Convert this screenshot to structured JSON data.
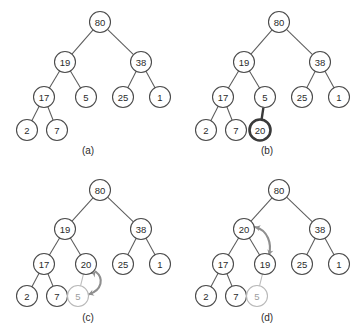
{
  "figure": {
    "colors": {
      "node_stroke": "#4b4b4b",
      "node_fill": "#ffffff",
      "node_text": "#2b2b2b",
      "edge": "#5c5c5c",
      "highlight_stroke": "#3a3a3a",
      "faded_stroke": "#b9b9b9",
      "faded_text": "#9d9d9d",
      "arrow": "#8f8f8f",
      "background": "#ffffff"
    },
    "node_radius": 10.5,
    "panels": [
      {
        "id": "panel-a",
        "caption": "(a)",
        "caption_pos": {
          "x": 88,
          "y": 150
        },
        "origin": {
          "x": 0,
          "y": 0
        },
        "size": {
          "w": 179,
          "h": 166
        },
        "nodes": [
          {
            "id": "a-80",
            "label": "80",
            "x": 100,
            "y": 22,
            "style": "normal"
          },
          {
            "id": "a-19",
            "label": "19",
            "x": 65,
            "y": 62,
            "style": "normal"
          },
          {
            "id": "a-38",
            "label": "38",
            "x": 141,
            "y": 62,
            "style": "normal"
          },
          {
            "id": "a-17",
            "label": "17",
            "x": 44,
            "y": 97,
            "style": "normal"
          },
          {
            "id": "a-5",
            "label": "5",
            "x": 86,
            "y": 97,
            "style": "normal"
          },
          {
            "id": "a-25",
            "label": "25",
            "x": 123,
            "y": 97,
            "style": "normal"
          },
          {
            "id": "a-1",
            "label": "1",
            "x": 160,
            "y": 97,
            "style": "normal"
          },
          {
            "id": "a-2",
            "label": "2",
            "x": 27,
            "y": 130,
            "style": "normal"
          },
          {
            "id": "a-7",
            "label": "7",
            "x": 57,
            "y": 130,
            "style": "normal"
          }
        ],
        "edges": [
          {
            "from": "a-80",
            "to": "a-19",
            "style": "normal"
          },
          {
            "from": "a-80",
            "to": "a-38",
            "style": "normal"
          },
          {
            "from": "a-19",
            "to": "a-17",
            "style": "normal"
          },
          {
            "from": "a-19",
            "to": "a-5",
            "style": "normal"
          },
          {
            "from": "a-38",
            "to": "a-25",
            "style": "normal"
          },
          {
            "from": "a-38",
            "to": "a-1",
            "style": "normal"
          },
          {
            "from": "a-17",
            "to": "a-2",
            "style": "normal"
          },
          {
            "from": "a-17",
            "to": "a-7",
            "style": "normal"
          }
        ],
        "swap_arrow": null
      },
      {
        "id": "panel-b",
        "caption": "(b)",
        "caption_pos": {
          "x": 267,
          "y": 150
        },
        "origin": {
          "x": 179,
          "y": 0
        },
        "size": {
          "w": 179,
          "h": 166
        },
        "nodes": [
          {
            "id": "b-80",
            "label": "80",
            "x": 279,
            "y": 22,
            "style": "normal"
          },
          {
            "id": "b-19",
            "label": "19",
            "x": 244,
            "y": 62,
            "style": "normal"
          },
          {
            "id": "b-38",
            "label": "38",
            "x": 320,
            "y": 62,
            "style": "normal"
          },
          {
            "id": "b-17",
            "label": "17",
            "x": 223,
            "y": 97,
            "style": "normal"
          },
          {
            "id": "b-5",
            "label": "5",
            "x": 265,
            "y": 97,
            "style": "normal"
          },
          {
            "id": "b-25",
            "label": "25",
            "x": 302,
            "y": 97,
            "style": "normal"
          },
          {
            "id": "b-1",
            "label": "1",
            "x": 339,
            "y": 97,
            "style": "normal"
          },
          {
            "id": "b-2",
            "label": "2",
            "x": 206,
            "y": 130,
            "style": "normal"
          },
          {
            "id": "b-7",
            "label": "7",
            "x": 236,
            "y": 130,
            "style": "normal"
          },
          {
            "id": "b-20",
            "label": "20",
            "x": 260,
            "y": 130,
            "style": "highlight"
          }
        ],
        "edges": [
          {
            "from": "b-80",
            "to": "b-19",
            "style": "normal"
          },
          {
            "from": "b-80",
            "to": "b-38",
            "style": "normal"
          },
          {
            "from": "b-19",
            "to": "b-17",
            "style": "normal"
          },
          {
            "from": "b-19",
            "to": "b-5",
            "style": "normal"
          },
          {
            "from": "b-38",
            "to": "b-25",
            "style": "normal"
          },
          {
            "from": "b-38",
            "to": "b-1",
            "style": "normal"
          },
          {
            "from": "b-17",
            "to": "b-2",
            "style": "normal"
          },
          {
            "from": "b-17",
            "to": "b-7",
            "style": "normal"
          },
          {
            "from": "b-5",
            "to": "b-20",
            "style": "highlight"
          }
        ],
        "swap_arrow": null
      },
      {
        "id": "panel-c",
        "caption": "(c)",
        "caption_pos": {
          "x": 88,
          "y": 317
        },
        "origin": {
          "x": 0,
          "y": 166
        },
        "size": {
          "w": 179,
          "h": 167
        },
        "nodes": [
          {
            "id": "c-80",
            "label": "80",
            "x": 100,
            "y": 190,
            "style": "normal"
          },
          {
            "id": "c-19",
            "label": "19",
            "x": 65,
            "y": 229,
            "style": "normal"
          },
          {
            "id": "c-38",
            "label": "38",
            "x": 141,
            "y": 229,
            "style": "normal"
          },
          {
            "id": "c-17",
            "label": "17",
            "x": 44,
            "y": 264,
            "style": "normal"
          },
          {
            "id": "c-20",
            "label": "20",
            "x": 86,
            "y": 264,
            "style": "normal"
          },
          {
            "id": "c-25",
            "label": "25",
            "x": 123,
            "y": 264,
            "style": "normal"
          },
          {
            "id": "c-1",
            "label": "1",
            "x": 160,
            "y": 264,
            "style": "normal"
          },
          {
            "id": "c-2",
            "label": "2",
            "x": 27,
            "y": 296,
            "style": "normal"
          },
          {
            "id": "c-7",
            "label": "7",
            "x": 57,
            "y": 296,
            "style": "normal"
          },
          {
            "id": "c-5",
            "label": "5",
            "x": 78,
            "y": 296,
            "style": "faded"
          }
        ],
        "edges": [
          {
            "from": "c-80",
            "to": "c-19",
            "style": "normal"
          },
          {
            "from": "c-80",
            "to": "c-38",
            "style": "normal"
          },
          {
            "from": "c-19",
            "to": "c-17",
            "style": "normal"
          },
          {
            "from": "c-19",
            "to": "c-20",
            "style": "normal"
          },
          {
            "from": "c-38",
            "to": "c-25",
            "style": "normal"
          },
          {
            "from": "c-38",
            "to": "c-1",
            "style": "normal"
          },
          {
            "from": "c-17",
            "to": "c-2",
            "style": "normal"
          },
          {
            "from": "c-17",
            "to": "c-7",
            "style": "normal"
          },
          {
            "from": "c-20",
            "to": "c-5",
            "style": "faded"
          }
        ],
        "swap_arrow": {
          "from": "c-20",
          "to": "c-5",
          "path": "M 95.5 271.5 C 104 278 102.5 290 88.5 294.5",
          "head_start": {
            "x": 95.5,
            "y": 271.5,
            "angle": -50
          },
          "head_end": {
            "x": 88.5,
            "y": 294.5,
            "angle": 160
          }
        }
      },
      {
        "id": "panel-d",
        "caption": "(d)",
        "caption_pos": {
          "x": 267,
          "y": 317
        },
        "origin": {
          "x": 179,
          "y": 166
        },
        "size": {
          "w": 179,
          "h": 167
        },
        "nodes": [
          {
            "id": "d-80",
            "label": "80",
            "x": 279,
            "y": 190,
            "style": "normal"
          },
          {
            "id": "d-20",
            "label": "20",
            "x": 244,
            "y": 229,
            "style": "normal"
          },
          {
            "id": "d-38",
            "label": "38",
            "x": 320,
            "y": 229,
            "style": "normal"
          },
          {
            "id": "d-17",
            "label": "17",
            "x": 223,
            "y": 264,
            "style": "normal"
          },
          {
            "id": "d-19",
            "label": "19",
            "x": 265,
            "y": 264,
            "style": "normal"
          },
          {
            "id": "d-25",
            "label": "25",
            "x": 302,
            "y": 264,
            "style": "normal"
          },
          {
            "id": "d-1",
            "label": "1",
            "x": 339,
            "y": 264,
            "style": "normal"
          },
          {
            "id": "d-2",
            "label": "2",
            "x": 206,
            "y": 296,
            "style": "normal"
          },
          {
            "id": "d-7",
            "label": "7",
            "x": 236,
            "y": 296,
            "style": "normal"
          },
          {
            "id": "d-5",
            "label": "5",
            "x": 257,
            "y": 296,
            "style": "faded"
          }
        ],
        "edges": [
          {
            "from": "d-80",
            "to": "d-20",
            "style": "normal"
          },
          {
            "from": "d-80",
            "to": "d-38",
            "style": "normal"
          },
          {
            "from": "d-20",
            "to": "d-17",
            "style": "normal"
          },
          {
            "from": "d-20",
            "to": "d-19",
            "style": "normal"
          },
          {
            "from": "d-38",
            "to": "d-25",
            "style": "normal"
          },
          {
            "from": "d-38",
            "to": "d-1",
            "style": "normal"
          },
          {
            "from": "d-17",
            "to": "d-2",
            "style": "normal"
          },
          {
            "from": "d-17",
            "to": "d-7",
            "style": "normal"
          },
          {
            "from": "d-19",
            "to": "d-5",
            "style": "faded"
          }
        ],
        "swap_arrow": {
          "from": "d-20",
          "to": "d-19",
          "path": "M 255 227 C 268 230 272 244 269 255",
          "head_start": {
            "x": 255,
            "y": 227,
            "angle": 195
          },
          "head_end": {
            "x": 269,
            "y": 255,
            "angle": 105
          }
        }
      }
    ]
  }
}
